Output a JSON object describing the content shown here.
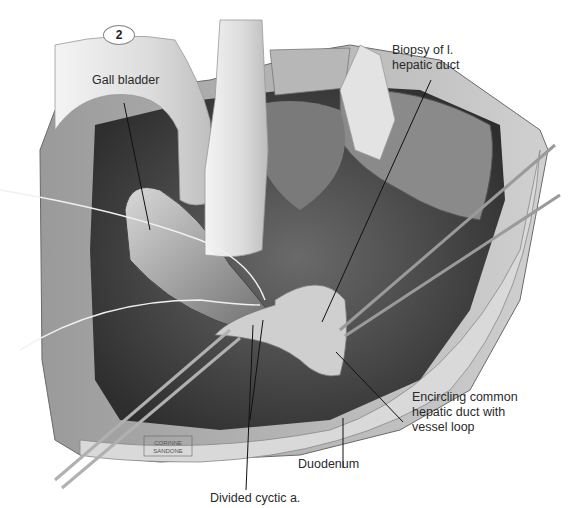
{
  "figure": {
    "number": "2",
    "signature": [
      "CORINNE",
      "SANDONE"
    ]
  },
  "labels": {
    "gall_bladder": "Gall bladder",
    "biopsy_line1": "Biopsy of l.",
    "biopsy_line2": "hepatic duct",
    "encircling_line1": "Encircling common",
    "encircling_line2": "hepatic duct with",
    "encircling_line3": "vessel loop",
    "duodenum": "Duodenum",
    "divided_cystic": "Divided cyctic a."
  },
  "colors": {
    "background": "#ffffff",
    "cavity_dark": "#4a4a4a",
    "tissue_mid": "#8c8c8c",
    "tissue_light": "#c8c8c8",
    "retractor": "#e6e6e6",
    "leader_line": "#111111",
    "label_text": "#2a2a2a"
  }
}
